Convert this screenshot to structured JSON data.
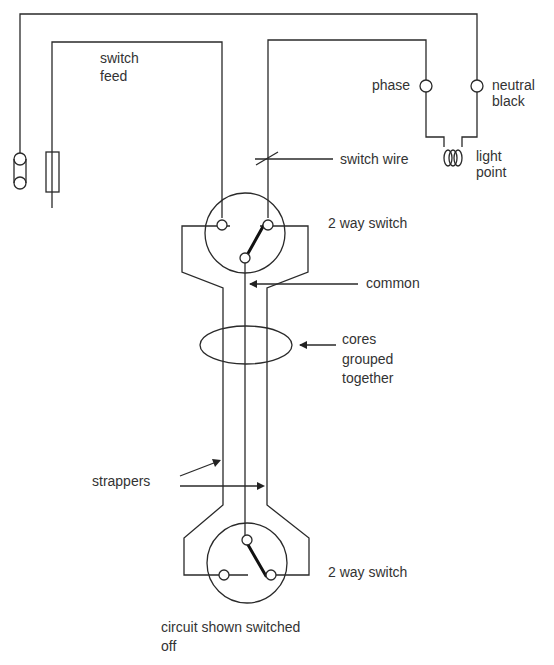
{
  "diagram": {
    "labels": {
      "switch_feed": [
        "switch",
        "feed"
      ],
      "phase": "phase",
      "neutral": [
        "neutral",
        "black"
      ],
      "switch_wire": "switch wire",
      "light_point": [
        "light",
        "point"
      ],
      "switch_top": "2 way switch",
      "common": "common",
      "cores": [
        "cores",
        "grouped",
        "together"
      ],
      "strappers": "strappers",
      "switch_bottom": "2 way switch",
      "caption": [
        "circuit shown switched",
        "off"
      ]
    },
    "components": [
      {
        "id": "neutral-link",
        "symbol": "link"
      },
      {
        "id": "fuse",
        "symbol": "fuse"
      },
      {
        "id": "light-point",
        "symbol": "lamp-coil"
      },
      {
        "id": "switch-1",
        "symbol": "two-way-switch",
        "state": "up-right"
      },
      {
        "id": "switch-2",
        "symbol": "two-way-switch",
        "state": "down-right"
      }
    ],
    "colors": {
      "line": "#2a2a2a",
      "text": "#333333",
      "background": "#ffffff"
    }
  }
}
